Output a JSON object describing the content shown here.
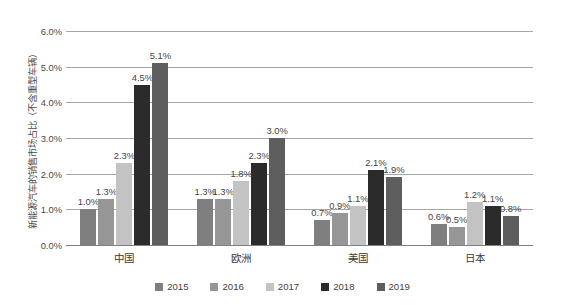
{
  "chart_data": {
    "type": "bar",
    "title": "",
    "subtitle": "",
    "xlabel": "",
    "ylabel": "新能源汽车的销售市场占比（不含重型车辆）",
    "ylim": [
      0,
      6
    ],
    "ytick_labels": [
      "0.0%",
      "1.0%",
      "2.0%",
      "3.0%",
      "4.0%",
      "5.0%",
      "6.0%"
    ],
    "ytick_values": [
      0,
      1,
      2,
      3,
      4,
      5,
      6
    ],
    "grid": true,
    "legend_position": "bottom",
    "categories": [
      "中国",
      "欧洲",
      "美国",
      "日本"
    ],
    "series": [
      {
        "name": "2015",
        "color": "#7f7f7f",
        "values": [
          1.0,
          1.3,
          0.7,
          0.6
        ],
        "labels": [
          "1.0%",
          "1.3%",
          "0.7%",
          "0.6%"
        ]
      },
      {
        "name": "2016",
        "color": "#969696",
        "values": [
          1.3,
          1.3,
          0.9,
          0.5
        ],
        "labels": [
          "1.3%",
          "1.3%",
          "0.9%",
          "0.5%"
        ]
      },
      {
        "name": "2017",
        "color": "#c3c3c3",
        "values": [
          2.3,
          1.8,
          1.1,
          1.2
        ],
        "labels": [
          "2.3%",
          "1.8%",
          "1.1%",
          "1.2%"
        ]
      },
      {
        "name": "2018",
        "color": "#2b2b2b",
        "values": [
          4.5,
          2.3,
          2.1,
          1.1
        ],
        "labels": [
          "4.5%",
          "2.3%",
          "2.1%",
          "1.1%"
        ]
      },
      {
        "name": "2019",
        "color": "#5e5e5e",
        "values": [
          5.1,
          3.0,
          1.9,
          0.8
        ],
        "labels": [
          "5.1%",
          "3.0%",
          "1.9%",
          "0.8%"
        ]
      }
    ]
  },
  "legend": {
    "items": [
      {
        "label": "2015",
        "color": "#7f7f7f"
      },
      {
        "label": "2016",
        "color": "#969696"
      },
      {
        "label": "2017",
        "color": "#c3c3c3"
      },
      {
        "label": "2018",
        "color": "#2b2b2b"
      },
      {
        "label": "2019",
        "color": "#5e5e5e"
      }
    ]
  }
}
